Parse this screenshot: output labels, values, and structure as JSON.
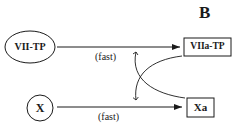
{
  "panel_label": "B",
  "nodes": {
    "vii_tp": {
      "label": "VII-TP",
      "shape": "ellipse"
    },
    "viia_tp": {
      "label": "VIIa-TP",
      "shape": "box"
    },
    "x": {
      "label": "X",
      "shape": "circle"
    },
    "xa": {
      "label": "Xa",
      "shape": "box"
    }
  },
  "edges": [
    {
      "from": "VII-TP",
      "to": "VIIa-TP",
      "label": "(fast)"
    },
    {
      "from": "X",
      "to": "Xa",
      "label": "(fast)"
    },
    {
      "from": "VIIa-TP",
      "to": "X→Xa reaction",
      "type": "feedback-curve"
    },
    {
      "from": "Xa",
      "to": "VII-TP→VIIa-TP reaction",
      "type": "feedback-curve"
    }
  ],
  "colors": {
    "stroke": "#1a1a1a",
    "background": "#ffffff"
  }
}
